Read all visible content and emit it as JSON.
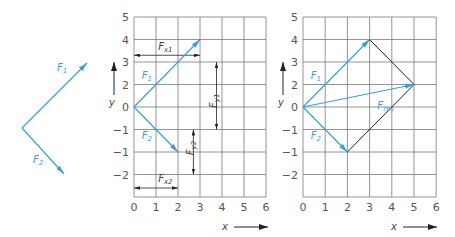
{
  "colors": {
    "vector": "#3a9fd8",
    "grid": "#7a7a7a",
    "dimension": "#222222",
    "construction": "#222222",
    "tick_text": "#555555"
  },
  "left_diagram": {
    "origin": [
      22,
      128
    ],
    "vectors": [
      {
        "name": "F",
        "sub": "1",
        "tip": [
          87,
          63
        ],
        "label_pos": [
          57,
          71
        ]
      },
      {
        "name": "F",
        "sub": "2",
        "tip": [
          64,
          174
        ],
        "label_pos": [
          33,
          163
        ]
      }
    ]
  },
  "panels": [
    {
      "id": "components",
      "grid": {
        "left": 134,
        "top": 17,
        "col_w": 22,
        "row_h": 22.5,
        "cols": 6,
        "rows": 8
      },
      "x_ticks": [
        "0",
        "1",
        "2",
        "3",
        "4",
        "5",
        "6"
      ],
      "y_ticks": [
        "5",
        "4",
        "3",
        "2",
        "0",
        "-1",
        "-1",
        "-2"
      ],
      "x_axis_label": "x",
      "y_axis_label": "y",
      "vectors": [
        {
          "name": "F",
          "sub": "1",
          "from": [
            0,
            4
          ],
          "to": [
            3,
            1
          ],
          "label_cell": [
            0.35,
            2.75
          ]
        },
        {
          "name": "F",
          "sub": "2",
          "from": [
            0,
            4
          ],
          "to": [
            2,
            6
          ],
          "label_cell": [
            0.35,
            5.4
          ]
        }
      ],
      "dimensions": [
        {
          "name": "F",
          "sub": "x1",
          "orient": "h",
          "a": [
            0,
            1.7
          ],
          "b": [
            3,
            1.7
          ],
          "label_cell": [
            1.1,
            1.45
          ]
        },
        {
          "name": "F",
          "sub": "y1",
          "orient": "v",
          "a": [
            3.75,
            2
          ],
          "b": [
            3.75,
            5
          ],
          "label_cell": [
            3.4,
            3.6
          ]
        },
        {
          "name": "F",
          "sub": "y2",
          "orient": "v",
          "a": [
            2.7,
            5
          ],
          "b": [
            2.7,
            7
          ],
          "label_cell": [
            2.35,
            5.7
          ]
        },
        {
          "name": "F",
          "sub": "x2",
          "orient": "h",
          "a": [
            0,
            7.6
          ],
          "b": [
            2,
            7.6
          ],
          "label_cell": [
            1.1,
            7.35
          ]
        }
      ]
    },
    {
      "id": "resultant",
      "grid": {
        "left": 303,
        "top": 17,
        "col_w": 22.2,
        "row_h": 22.5,
        "cols": 6,
        "rows": 8
      },
      "x_ticks": [
        "0",
        "1",
        "2",
        "3",
        "4",
        "5",
        "6"
      ],
      "y_ticks": [
        "5",
        "4",
        "3",
        "2",
        "0",
        "-1",
        "-1",
        "-2"
      ],
      "x_axis_label": "x",
      "y_axis_label": "y",
      "vectors": [
        {
          "name": "F",
          "sub": "1",
          "from": [
            0,
            4
          ],
          "to": [
            3,
            1
          ],
          "label_cell": [
            0.35,
            2.75
          ]
        },
        {
          "name": "F",
          "sub": "2",
          "from": [
            0,
            4
          ],
          "to": [
            2,
            6
          ],
          "label_cell": [
            0.35,
            5.4
          ]
        },
        {
          "name": "F",
          "sub": "res",
          "from": [
            0,
            4
          ],
          "to": [
            5,
            3
          ],
          "label_cell": [
            3.35,
            4.1
          ]
        }
      ],
      "construction_lines": [
        {
          "from": [
            3,
            1
          ],
          "to": [
            5,
            3
          ]
        },
        {
          "from": [
            2,
            6
          ],
          "to": [
            5,
            3
          ]
        }
      ]
    }
  ]
}
